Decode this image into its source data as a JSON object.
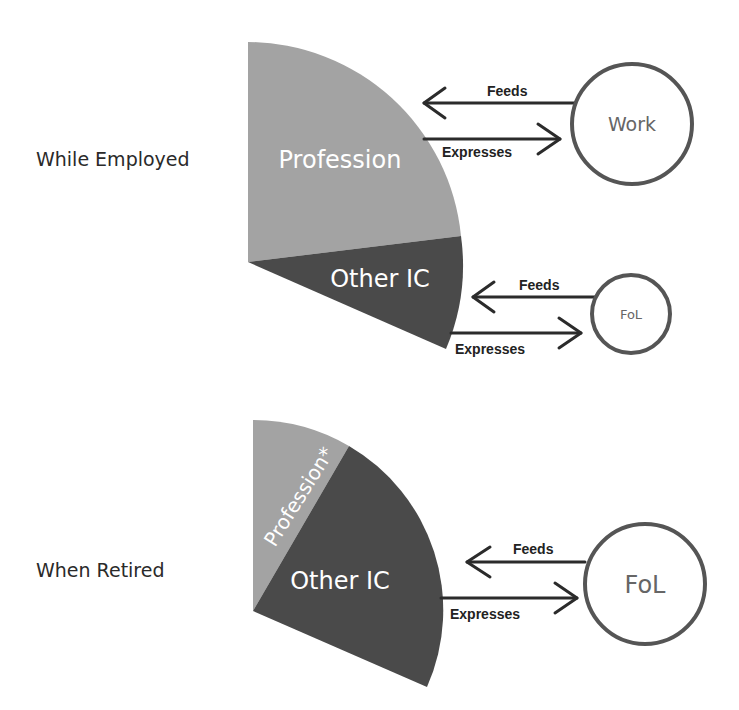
{
  "colors": {
    "profession": "#a3a3a3",
    "other_ic": "#4a4a4a",
    "node_stroke": "#555555",
    "arrow": "#2b2b2b"
  },
  "diagrams": [
    {
      "row_label": "While Employed",
      "segments": [
        {
          "name": "profession",
          "label": "Profession",
          "share": 0.75
        },
        {
          "name": "other_ic",
          "label": "Other IC",
          "share": 0.25
        }
      ],
      "links": [
        {
          "node": "Work",
          "feeds": "Feeds",
          "expresses": "Expresses"
        },
        {
          "node": "FoL",
          "feeds": "Feeds",
          "expresses": "Expresses"
        }
      ]
    },
    {
      "row_label": "When Retired",
      "segments": [
        {
          "name": "profession",
          "label": "Profession*",
          "share": 0.4
        },
        {
          "name": "other_ic",
          "label": "Other IC",
          "share": 0.6
        }
      ],
      "links": [
        {
          "node": "FoL",
          "feeds": "Feeds",
          "expresses": "Expresses"
        }
      ]
    }
  ]
}
